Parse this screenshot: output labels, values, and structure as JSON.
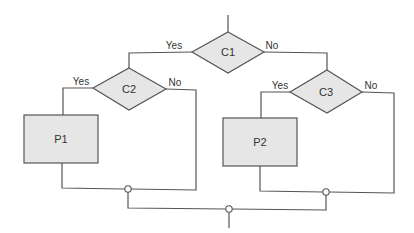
{
  "diagram": {
    "type": "flowchart",
    "colors": {
      "line": "#555555",
      "fill": "#e6e6e6",
      "background": "#ffffff"
    },
    "nodes": {
      "c1": {
        "label": "C1",
        "kind": "decision"
      },
      "c2": {
        "label": "C2",
        "kind": "decision"
      },
      "c3": {
        "label": "C3",
        "kind": "decision"
      },
      "p1": {
        "label": "P1",
        "kind": "process"
      },
      "p2": {
        "label": "P2",
        "kind": "process"
      }
    },
    "edge_labels": {
      "c1_yes": "Yes",
      "c1_no": "No",
      "c2_yes": "Yes",
      "c2_no": "No",
      "c3_yes": "Yes",
      "c3_no": "No"
    },
    "edges": [
      {
        "from": "start",
        "to": "c1"
      },
      {
        "from": "c1",
        "to": "c2",
        "label": "Yes"
      },
      {
        "from": "c1",
        "to": "c3",
        "label": "No"
      },
      {
        "from": "c2",
        "to": "p1",
        "label": "Yes"
      },
      {
        "from": "c2",
        "to": "junction-left",
        "label": "No"
      },
      {
        "from": "p1",
        "to": "junction-left"
      },
      {
        "from": "c3",
        "to": "p2",
        "label": "Yes"
      },
      {
        "from": "c3",
        "to": "junction-right",
        "label": "No"
      },
      {
        "from": "p2",
        "to": "junction-right"
      },
      {
        "from": "junction-left",
        "to": "junction-final"
      },
      {
        "from": "junction-right",
        "to": "junction-final"
      },
      {
        "from": "junction-final",
        "to": "end"
      }
    ]
  }
}
